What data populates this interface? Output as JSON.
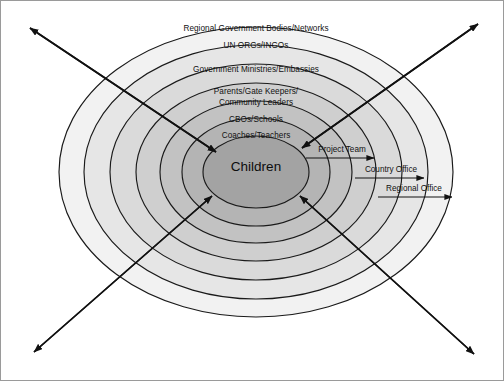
{
  "diagram": {
    "background_color": "#ffffff",
    "frame_color": "#9a9a9a",
    "outline_color": "#1a1a1a",
    "center": {
      "label": "Children",
      "fill_color": "#a3a3a3"
    },
    "rings": [
      {
        "index": 1,
        "label": "Regional Government Bodies/Networks",
        "fill_color": "#f2f2f2"
      },
      {
        "index": 2,
        "label": "UN ORGs/INGOs",
        "fill_color": "#e6e6e6"
      },
      {
        "index": 3,
        "label": "Government Ministries/Embassies",
        "fill_color": "#dadada"
      },
      {
        "index": 4,
        "label_line1": "Parents/Gate Keepers/",
        "label_line2": "Community Leaders",
        "fill_color": "#cfcfcf"
      },
      {
        "index": 5,
        "label": "CBOs/Schools",
        "fill_color": "#c2c2c2"
      },
      {
        "index": 6,
        "label": "Coaches/Teachers",
        "fill_color": "#b4b4b4"
      }
    ],
    "callouts": [
      {
        "index": 1,
        "label": "Project Team"
      },
      {
        "index": 2,
        "label": "Country Office"
      },
      {
        "index": 3,
        "label": "Regional Office"
      }
    ],
    "diagonal_arrows": [
      {
        "name": "top-left",
        "direction": "outward"
      },
      {
        "name": "top-right",
        "direction": "outward"
      },
      {
        "name": "bottom-left",
        "direction": "outward"
      },
      {
        "name": "bottom-right",
        "direction": "outward"
      }
    ]
  }
}
